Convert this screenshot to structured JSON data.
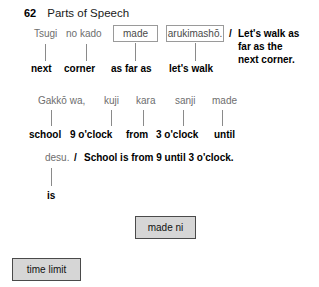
{
  "header": {
    "number": "62",
    "title": "Parts of Speech"
  },
  "example_1": {
    "tokens": [
      {
        "text": "Tsugi",
        "boxed": false
      },
      {
        "text": "no kado",
        "boxed": false
      },
      {
        "text": "made",
        "boxed": true
      },
      {
        "text": "arukimashō.",
        "boxed": true
      }
    ],
    "glosses": [
      "next",
      "corner",
      "as far as",
      "let's walk"
    ],
    "translation_marker": "/",
    "translation_lines": [
      "Let's walk as",
      "far as the",
      "next corner."
    ]
  },
  "example_2": {
    "tokens": [
      {
        "text": "Gakkō wa,",
        "boxed": false
      },
      {
        "text": "kuji",
        "boxed": false
      },
      {
        "text": "kara",
        "boxed": false
      },
      {
        "text": "sanji",
        "boxed": false
      },
      {
        "text": "made",
        "boxed": false
      }
    ],
    "glosses": [
      "school",
      "9 o'clock",
      "from",
      "3 o'clock",
      "until"
    ],
    "continuation_token": "desu.",
    "translation_marker": "/",
    "translation": "School is from 9 until 3 o'clock.",
    "continuation_gloss": "is"
  },
  "chips": [
    {
      "label": "made ni",
      "name": "chip-made-ni"
    },
    {
      "label": "time limit",
      "name": "chip-time-limit"
    }
  ],
  "colors": {
    "token_text": "#6e6e6e",
    "gloss_text": "#000000",
    "box_border": "#9a9a9a",
    "chip_fill": "#d6d6d6",
    "chip_border": "#4a4a4a",
    "tick": "#8a8a8a",
    "background": "#ffffff"
  }
}
